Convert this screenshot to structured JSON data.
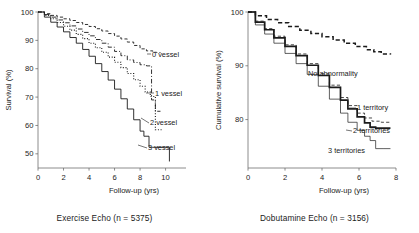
{
  "figure": {
    "panels": [
      {
        "id": "exercise-echo",
        "caption": "Exercise Echo (n = 5375)",
        "chart_data": {
          "type": "line",
          "title": "",
          "xlabel": "Follow-up (yrs)",
          "ylabel": "Survival (%)",
          "xlim": [
            0,
            11.6
          ],
          "ylim": [
            45,
            100
          ],
          "xticks": [
            0,
            2,
            4,
            6,
            8,
            10
          ],
          "yticks": [
            50,
            60,
            70,
            80,
            90,
            100
          ],
          "grid": false,
          "legend_position": "inline-right-of-curve-ends",
          "series": [
            {
              "name": "0 vessel",
              "label": "0 vessel",
              "linestyle": "dashed",
              "linewidth": 0.9,
              "x": [
                0,
                0.5,
                1,
                1.5,
                2,
                2.5,
                3,
                3.5,
                4,
                4.5,
                5,
                5.5,
                6,
                6.5,
                7,
                7.5,
                8,
                8.5,
                9,
                9.3,
                9.6
              ],
              "y": [
                100,
                99.4,
                98.8,
                98.2,
                97.6,
                97.0,
                96.3,
                95.6,
                94.9,
                94.1,
                93.3,
                92.4,
                91.5,
                90.5,
                89.4,
                88.2,
                87.0,
                86.3,
                85.8,
                85.7,
                85.7
              ]
            },
            {
              "name": "1 vessel",
              "label": "1 vessel",
              "linestyle": "dashdot",
              "linewidth": 0.9,
              "x": [
                0,
                0.5,
                1,
                1.5,
                2,
                2.5,
                3,
                3.5,
                4,
                4.5,
                5,
                5.5,
                6,
                6.5,
                7,
                7.5,
                8,
                8.5,
                8.9,
                9.2,
                9.6
              ],
              "y": [
                100,
                99.1,
                98.2,
                97.2,
                96.2,
                95.1,
                94.0,
                92.8,
                91.6,
                90.3,
                89.0,
                87.6,
                86.1,
                84.6,
                83.1,
                82.2,
                81.4,
                81.0,
                69.0,
                65.0,
                65.0
              ]
            },
            {
              "name": "2 vessel",
              "label": "2 vessel",
              "linestyle": "dotted",
              "linewidth": 1.1,
              "x": [
                0,
                0.5,
                1,
                1.5,
                2,
                2.5,
                3,
                3.5,
                4,
                4.5,
                5,
                5.5,
                6,
                6.5,
                7,
                7.5,
                8,
                8.4,
                8.8,
                9.2,
                9.8
              ],
              "y": [
                100,
                98.8,
                97.6,
                96.3,
                95.0,
                93.6,
                92.1,
                90.6,
                89.0,
                87.4,
                85.8,
                84.1,
                82.3,
                80.4,
                78.3,
                76.1,
                73.8,
                71.8,
                70.2,
                58.5,
                58.5
              ]
            },
            {
              "name": "3 vessel",
              "label": "3 vessel",
              "linestyle": "solid",
              "linewidth": 0.9,
              "x": [
                0,
                0.5,
                1,
                1.5,
                2,
                2.5,
                3,
                3.5,
                4,
                4.5,
                5,
                5.5,
                6,
                6.5,
                7,
                7.5,
                8,
                8.3,
                8.7,
                9.0,
                10.3
              ],
              "y": [
                100,
                98.2,
                96.4,
                94.7,
                93.0,
                91.0,
                89.0,
                86.8,
                84.4,
                81.8,
                79.0,
                76.0,
                72.8,
                69.4,
                65.8,
                62.0,
                58.0,
                56.2,
                52.3,
                52.3,
                47.3
              ]
            }
          ]
        }
      },
      {
        "id": "dobutamine-echo",
        "caption": "Dobutamine Echo (n = 3156)",
        "chart_data": {
          "type": "line",
          "title": "",
          "xlabel": "Follow-up (yrs)",
          "ylabel": "Cumulative survival (%)",
          "xlim": [
            0,
            8
          ],
          "ylim": [
            71,
            100
          ],
          "xticks": [
            0,
            2,
            4,
            6,
            8
          ],
          "yticks": [
            80,
            90,
            100
          ],
          "grid": false,
          "legend_position": "inline-right-of-curve-ends",
          "series": [
            {
              "name": "No abnormality",
              "label": "No abnormality",
              "linestyle": "dashed",
              "linewidth": 1.5,
              "x": [
                0,
                0.4,
                1,
                1.6,
                2.2,
                2.8,
                3.4,
                4,
                4.6,
                5.2,
                5.8,
                6.4,
                6.8,
                7.2,
                7.7
              ],
              "y": [
                100,
                99.3,
                98.6,
                98.0,
                97.3,
                96.6,
                96.0,
                95.4,
                94.8,
                94.2,
                93.6,
                93.0,
                92.6,
                92.2,
                92.1
              ]
            },
            {
              "name": "1 territory",
              "label": "1 territory",
              "linestyle": "dashed",
              "linewidth": 0.8,
              "x": [
                0,
                0.4,
                0.9,
                1.4,
                2,
                2.6,
                3.2,
                3.8,
                4.4,
                5,
                5.4,
                5.9,
                6.3,
                6.7,
                7.2,
                7.7
              ],
              "y": [
                100,
                98.3,
                96.9,
                95.5,
                93.9,
                92.2,
                90.4,
                88.5,
                86.4,
                84.1,
                82.6,
                81.2,
                80.3,
                79.7,
                79.5,
                79.5
              ]
            },
            {
              "name": "2 territories",
              "label": "2 territories",
              "linestyle": "solid",
              "linewidth": 1.7,
              "x": [
                0,
                0.4,
                0.9,
                1.4,
                2,
                2.6,
                3.2,
                3.8,
                4.4,
                5,
                5.4,
                5.9,
                6.3,
                6.6,
                6.9,
                7.3,
                7.7
              ],
              "y": [
                100,
                98.1,
                96.7,
                95.2,
                93.6,
                91.9,
                90.1,
                88.2,
                86.0,
                83.6,
                82.0,
                80.5,
                79.4,
                78.6,
                78.4,
                78.4,
                78.4
              ]
            },
            {
              "name": "3 territories",
              "label": "3 territories",
              "linestyle": "solid",
              "linewidth": 0.7,
              "x": [
                0,
                0.4,
                0.9,
                1.4,
                2,
                2.6,
                3.2,
                3.8,
                4.4,
                5,
                5.4,
                5.9,
                6.3,
                6.6,
                6.9,
                7.3,
                7.7
              ],
              "y": [
                100,
                97.6,
                95.9,
                94.2,
                92.3,
                90.4,
                88.4,
                86.2,
                83.8,
                81.2,
                79.5,
                78.0,
                76.9,
                76.1,
                74.6,
                74.6,
                74.6
              ]
            }
          ]
        }
      }
    ]
  }
}
